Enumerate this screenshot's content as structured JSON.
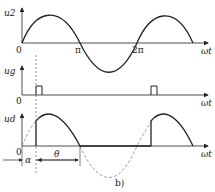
{
  "figure": {
    "caption": "b)",
    "panels": [
      {
        "id": "u2",
        "ylabel": "u2",
        "xlabel": "ωt",
        "origin": "0",
        "ticks": [
          "π",
          "2π"
        ]
      },
      {
        "id": "ug",
        "ylabel": "ug",
        "xlabel": "ωt",
        "origin": "0"
      },
      {
        "id": "ud",
        "ylabel": "ud",
        "xlabel": "ωt",
        "origin": "0"
      }
    ],
    "annotations": {
      "alpha": "α",
      "theta": "θ"
    },
    "colors": {
      "line": "#222222",
      "dashed": "#888888"
    }
  }
}
